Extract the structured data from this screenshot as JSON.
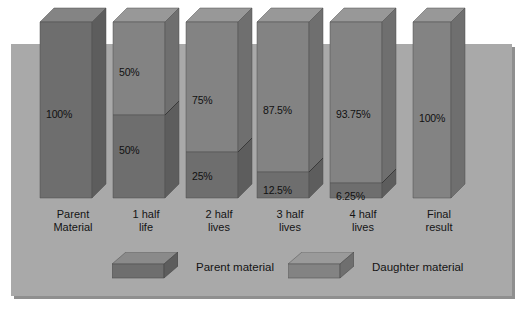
{
  "figure": {
    "panel_color": "#a9a9a9",
    "parent_color": "#6e6e6e",
    "daughter_color": "#838383",
    "top_face_color": "#848484",
    "side_face_color": "#5d5d5d",
    "daughter_side_color": "#6f6f6f",
    "daughter_top_color": "#989898",
    "text_color": "#141414"
  },
  "chart_data": {
    "type": "bar",
    "title": "",
    "xlabel": "",
    "ylabel": "",
    "ylim": [
      0,
      100
    ],
    "grid": false,
    "legend_position": "bottom",
    "categories": [
      "Parent\nMaterial",
      "1 half\nlife",
      "2 half\nlives",
      "3 half\nlives",
      "4 half\nlives",
      "Final\nresult"
    ],
    "series": [
      {
        "name": "Parent material",
        "values": [
          100,
          50,
          25,
          12.5,
          6.25,
          0
        ],
        "labels": [
          "100%",
          "50%",
          "25%",
          "12.5%",
          "6.25%",
          ""
        ]
      },
      {
        "name": "Daughter material",
        "values": [
          0,
          50,
          75,
          87.5,
          93.75,
          100
        ],
        "labels": [
          "",
          "50%",
          "75%",
          "87.5%",
          "93.75%",
          "100%"
        ]
      }
    ],
    "bars": [
      {
        "category": "Parent\nMaterial",
        "x": 40,
        "width": 52,
        "depth": 14,
        "top": 22,
        "bottom": 198,
        "split": null,
        "daughter_label": "",
        "parent_label": "100%",
        "parent_label_y": 108,
        "daughter_label_y": 0,
        "all_parent": true
      },
      {
        "category": "1 half\nlife",
        "x": 113,
        "width": 52,
        "depth": 14,
        "top": 22,
        "bottom": 198,
        "split": 115,
        "daughter_label": "50%",
        "parent_label": "50%",
        "daughter_label_y": 66,
        "parent_label_y": 144
      },
      {
        "category": "2 half\nlives",
        "x": 186,
        "width": 52,
        "depth": 14,
        "top": 22,
        "bottom": 198,
        "split": 152,
        "daughter_label": "75%",
        "parent_label": "25%",
        "daughter_label_y": 94,
        "parent_label_y": 170
      },
      {
        "category": "3 half\nlives",
        "x": 257,
        "width": 52,
        "depth": 14,
        "top": 22,
        "bottom": 198,
        "split": 172,
        "daughter_label": "87.5%",
        "parent_label": "12.5%",
        "daughter_label_y": 104,
        "parent_label_y": 184
      },
      {
        "category": "4 half\nlives",
        "x": 330,
        "width": 52,
        "depth": 14,
        "top": 22,
        "bottom": 198,
        "split": 183,
        "daughter_label": "93.75%",
        "parent_label": "6.25%",
        "daughter_label_y": 108,
        "parent_label_y": 190
      },
      {
        "category": "Final\nresult",
        "x": 413,
        "width": 38,
        "depth": 14,
        "top": 22,
        "bottom": 198,
        "split": null,
        "daughter_label": "100%",
        "parent_label": "",
        "daughter_label_y": 112,
        "parent_label_y": 0,
        "all_daughter": true
      }
    ],
    "legend": [
      {
        "label": "Parent material",
        "swatch": "parent"
      },
      {
        "label": "Daughter material",
        "swatch": "daughter"
      }
    ]
  }
}
